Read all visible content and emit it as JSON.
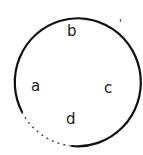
{
  "diagram": {
    "shape": "circle",
    "stroke_color": "#111111",
    "background": "#ffffff",
    "labels": [
      {
        "id": "a",
        "text": "a",
        "position": "left"
      },
      {
        "id": "b",
        "text": "b",
        "position": "top"
      },
      {
        "id": "c",
        "text": "c",
        "position": "right"
      },
      {
        "id": "d",
        "text": "d",
        "position": "bottom"
      }
    ],
    "tick_mark": "'"
  }
}
